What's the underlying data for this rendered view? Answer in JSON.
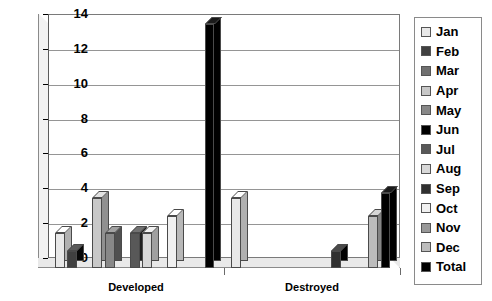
{
  "chart_data": {
    "type": "bar",
    "title": "",
    "subtitle": "",
    "xlabel": "",
    "ylabel": "",
    "categories": [
      "Developed",
      "Destroyed"
    ],
    "ylim": [
      0,
      14
    ],
    "ytick_labels": [
      "0",
      "2",
      "4",
      "6",
      "8",
      "10",
      "12",
      "14"
    ],
    "ytick_values": [
      0,
      2,
      4,
      6,
      8,
      10,
      12,
      14
    ],
    "grid": "horizontal",
    "legend_position": "right",
    "style": "3d-clustered-bar",
    "series": [
      {
        "name": "Jan",
        "color": "#e8e8e8",
        "values": [
          2,
          4
        ]
      },
      {
        "name": "Feb",
        "color": "#404040",
        "values": [
          1,
          0
        ]
      },
      {
        "name": "Mar",
        "color": "#707070",
        "values": [
          0,
          0
        ]
      },
      {
        "name": "Apr",
        "color": "#c8c8c8",
        "values": [
          4,
          0
        ]
      },
      {
        "name": "May",
        "color": "#888888",
        "values": [
          2,
          0
        ]
      },
      {
        "name": "Jun",
        "color": "#000000",
        "values": [
          0,
          0
        ]
      },
      {
        "name": "Jul",
        "color": "#585858",
        "values": [
          2,
          0
        ]
      },
      {
        "name": "Aug",
        "color": "#d8d8d8",
        "values": [
          2,
          0
        ]
      },
      {
        "name": "Sep",
        "color": "#303030",
        "values": [
          0,
          1
        ]
      },
      {
        "name": "Oct",
        "color": "#f0f0f0",
        "values": [
          3,
          0
        ]
      },
      {
        "name": "Nov",
        "color": "#989898",
        "values": [
          0,
          0
        ]
      },
      {
        "name": "Dec",
        "color": "#bcbcbc",
        "values": [
          0,
          3
        ]
      },
      {
        "name": "Total",
        "color": "#000000",
        "values": [
          14,
          4.3
        ]
      }
    ]
  },
  "legend": {
    "items": [
      {
        "label": "Jan"
      },
      {
        "label": "Feb"
      },
      {
        "label": "Mar"
      },
      {
        "label": "Apr"
      },
      {
        "label": "May"
      },
      {
        "label": "Jun"
      },
      {
        "label": "Jul"
      },
      {
        "label": "Aug"
      },
      {
        "label": "Sep"
      },
      {
        "label": "Oct"
      },
      {
        "label": "Nov"
      },
      {
        "label": "Dec"
      },
      {
        "label": "Total"
      }
    ]
  }
}
